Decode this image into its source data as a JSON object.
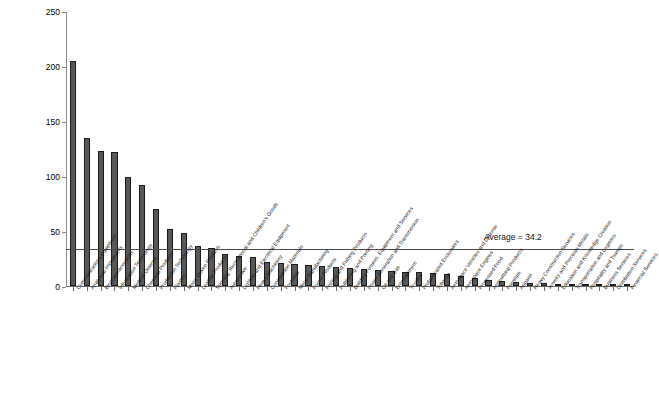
{
  "chart_data": {
    "type": "bar",
    "title": "",
    "xlabel": "",
    "ylabel": "Patents per 10,000 Employees, 2000",
    "ylim": [
      0,
      250
    ],
    "yticks": [
      0,
      50,
      100,
      150,
      200,
      250
    ],
    "grid": false,
    "legend": null,
    "annotations": [
      {
        "name": "average-line",
        "label": "Average = 34.2",
        "value": 34.2
      }
    ],
    "categories": [
      "Communications Equipment",
      "Analytical Instruments",
      "Biopharmaceuticals",
      "Information Technology",
      "Medical Devices",
      "Chemical Products",
      "Production Technology",
      "Plastics",
      "Motor Driven Products",
      "Leather Products",
      "Sporting, Recreational and Children's Goods",
      "Automotive",
      "Lighting and Electrical Equipment",
      "Heavy Machinery",
      "Construction Materials",
      "Footwear",
      "Metal Manufacturing",
      "Forest Products",
      "Fishing and Fishing Products",
      "Publishing and Printing",
      "Building Fixtures, Equipment and Services",
      "Power Generation and Transmission",
      "Oil and Gas",
      "Entertainment",
      "Textiles",
      "Prefabricated Enclosures",
      "Tobacco",
      "Aerospace Vehicles and Defense",
      "Aerospace Engines",
      "Processed Food",
      "Agricultural Products",
      "Furniture",
      "Apparel",
      "Heavy Construction Services",
      "Jewelry and Precious Metals",
      "Education and Knowledge Creation",
      "Transportation and Logistics",
      "Hospitality and Tourism",
      "Business Services",
      "Distribution Services",
      "Financial Services"
    ],
    "values": [
      205.0,
      135.0,
      123.0,
      121.5,
      99.0,
      92.0,
      70.0,
      52.0,
      48.0,
      36.0,
      34.5,
      29.5,
      27.5,
      26.5,
      21.5,
      20.5,
      20.0,
      19.5,
      18.0,
      17.0,
      16.5,
      15.5,
      14.5,
      13.5,
      13.0,
      12.5,
      11.5,
      10.5,
      9.0,
      7.5,
      5.5,
      4.5,
      3.5,
      2.8,
      2.5,
      2.0,
      1.6,
      1.3,
      1.1,
      0.9,
      0.7
    ]
  }
}
